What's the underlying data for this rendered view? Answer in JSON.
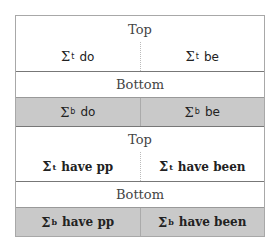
{
  "blocks": [
    {
      "top_header": "Top",
      "top_cells": [
        {
          "symbol": "Σ",
          "sup": "t",
          "label": "do"
        },
        {
          "symbol": "Σ",
          "sup": "t",
          "label": "be"
        }
      ],
      "bottom_header": "Bottom",
      "bottom_cells": [
        {
          "symbol": "Σ",
          "sup": "b",
          "label": "do"
        },
        {
          "symbol": "Σ",
          "sup": "b",
          "label": "be"
        }
      ]
    },
    {
      "top_header": "Top",
      "top_cells": [
        {
          "symbol": "Σ",
          "sup": "t",
          "label": "have pp"
        },
        {
          "symbol": "Σ",
          "sup": "t",
          "label": "have been"
        }
      ],
      "bottom_header": "Bottom",
      "bottom_cells": [
        {
          "symbol": "Σ",
          "sup": "b",
          "label": "have pp"
        },
        {
          "symbol": "Σ",
          "sup": "b",
          "label": "have been"
        }
      ]
    }
  ],
  "colors": {
    "shaded": "#c9c9c9",
    "border": "#a8a8a8"
  }
}
